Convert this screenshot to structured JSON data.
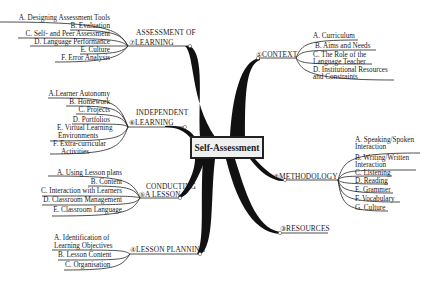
{
  "central": {
    "label": "Self-Assessment"
  },
  "branches": {
    "assessment": {
      "label_line1": "ASSESSMENT OF",
      "label_line2": "⑦LEARNING",
      "items": [
        "A. Designing Assessment Tools",
        "B. Evaluation",
        "C. Self- and Peer Assessment",
        "D. Language Performance",
        "E. Culture",
        "F. Error Analysis"
      ]
    },
    "independent": {
      "label_line1": "INDEPENDENT",
      "label_line2": "⑥LEARNING",
      "items": [
        "A.Learner Autonomy",
        "B. Homework",
        "C. Projects",
        "D. Portfolios",
        "E. Virtual Learning",
        "Environments",
        "F. Extra-curricular",
        "Activities"
      ]
    },
    "conducting": {
      "label_line1": "CONDUCTING",
      "label_line2": "⑤A LESSON",
      "items": [
        "A. Using Lesson plans",
        "B. Content",
        "C. Interaction with Learners",
        "D. Classroom Management",
        "E. Classroom Language"
      ]
    },
    "planning": {
      "label": "④LESSON PLANNING",
      "items": [
        "A. Identification of",
        "Learning Objectives",
        "B. Lesson Content",
        "C. Organisation"
      ]
    },
    "context": {
      "label": "①CONTEXT",
      "items": [
        "A. Curriculum",
        "B. Aims and Needs",
        "C. The Role of the",
        "Language Teacher",
        "D. Institutional Resources",
        "and Constraints"
      ]
    },
    "methodology": {
      "label": "②METHODOLOGY",
      "items": [
        "A. Speaking/Spoken",
        "Interaction",
        "B. Writing/Written",
        "Interaction",
        "C. Listening",
        "D. Reading",
        "E. Grammer",
        "F. Vocabulary",
        "G. Culture"
      ]
    },
    "resources": {
      "label": "③RESOURCES"
    }
  }
}
